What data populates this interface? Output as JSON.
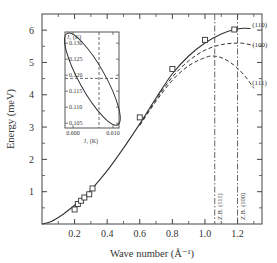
{
  "chart_data": {
    "type": "line",
    "title": "",
    "xlabel": "Wave number (Å⁻¹)",
    "ylabel": "Energy (meV)",
    "xlim": [
      0,
      1.35
    ],
    "ylim": [
      0,
      6.5
    ],
    "grid": false,
    "x_ticks": [
      0.2,
      0.4,
      0.6,
      0.8,
      1.0,
      1.2
    ],
    "x_tick_labels": [
      "0.2",
      "0.4",
      "0.6",
      "0.8",
      "1.0",
      "1.2"
    ],
    "x_minor_ticks": [
      0.1,
      0.3,
      0.5,
      0.7,
      0.9,
      1.1,
      1.3
    ],
    "y_ticks": [
      1,
      2,
      3,
      4,
      5,
      6
    ],
    "y_tick_labels": [
      "1",
      "2",
      "3",
      "4",
      "5",
      "6"
    ],
    "y_minor_ticks": [
      0.5,
      1.5,
      2.5,
      3.5,
      4.5,
      5.5
    ],
    "series": [
      {
        "name": "(110)",
        "style": "solid",
        "x": [
          0,
          0.05,
          0.1,
          0.15,
          0.2,
          0.25,
          0.3,
          0.4,
          0.5,
          0.6,
          0.7,
          0.8,
          0.9,
          1.0,
          1.1,
          1.18,
          1.24,
          1.28
        ],
        "y": [
          0,
          0.06,
          0.2,
          0.38,
          0.58,
          0.8,
          1.05,
          1.65,
          2.35,
          3.1,
          3.9,
          4.65,
          5.2,
          5.6,
          5.88,
          6.02,
          6.06,
          6.05
        ]
      },
      {
        "name": "(100)",
        "style": "dashed",
        "x": [
          0.6,
          0.7,
          0.8,
          0.9,
          1.0,
          1.1,
          1.2,
          1.25,
          1.3
        ],
        "y": [
          3.08,
          3.85,
          4.55,
          5.05,
          5.38,
          5.55,
          5.6,
          5.58,
          5.52
        ]
      },
      {
        "name": "(111)",
        "style": "dashed",
        "x": [
          0.6,
          0.7,
          0.8,
          0.9,
          1.0,
          1.05,
          1.1,
          1.15,
          1.2,
          1.25,
          1.3
        ],
        "y": [
          3.05,
          3.8,
          4.45,
          4.9,
          5.15,
          5.2,
          5.15,
          5.02,
          4.82,
          4.55,
          4.2
        ]
      }
    ],
    "markers": {
      "name": "experimental points",
      "shape": "square",
      "x": [
        0.2,
        0.22,
        0.24,
        0.26,
        0.29,
        0.31,
        0.6,
        0.8,
        1.0,
        1.18
      ],
      "y": [
        0.45,
        0.62,
        0.72,
        0.82,
        0.92,
        1.1,
        3.3,
        4.8,
        5.7,
        6.02
      ]
    },
    "vertical_lines": [
      {
        "x": 1.06,
        "label": "Z.B. (111)",
        "style": "dash-dot"
      },
      {
        "x": 1.2,
        "label": "Z.B. (100)",
        "style": "dash-dot"
      }
    ],
    "branch_labels": [
      {
        "text": "(110)",
        "x": 1.29,
        "y": 6.15
      },
      {
        "text": "(100)",
        "x": 1.29,
        "y": 5.55
      },
      {
        "text": "(111)",
        "x": 1.29,
        "y": 4.35
      }
    ],
    "inset": {
      "type": "line",
      "xlabel": "J₁ (K)",
      "ylabel": "J₂ (K)",
      "xlim": [
        0.598,
        0.6115
      ],
      "ylim": [
        0.1035,
        0.1335
      ],
      "x_ticks": [
        0.6,
        0.61
      ],
      "x_tick_labels": [
        "0.600",
        "0.610"
      ],
      "y_ticks": [
        0.105,
        0.11,
        0.115,
        0.12,
        0.125,
        0.13
      ],
      "y_tick_labels": [
        "0.105",
        "0.110",
        "0.115",
        "0.120",
        "0.125",
        "0.130"
      ],
      "ellipse": {
        "center": [
          0.6048,
          0.1185
        ],
        "description": "confidence ellipse tilted from upper-left to lower-right",
        "upper_left_extreme": [
          0.5985,
          0.133
        ],
        "lower_right_extreme": [
          0.6112,
          0.1045
        ]
      },
      "crosshair": {
        "x": 0.6065,
        "y": 0.119
      }
    }
  }
}
